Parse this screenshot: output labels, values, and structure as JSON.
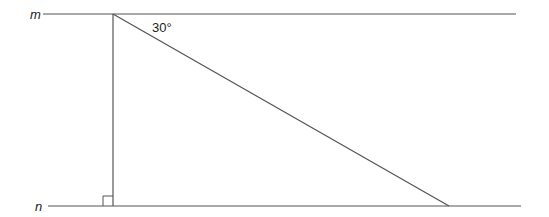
{
  "diagram": {
    "lines": [
      {
        "label": "m",
        "x1": 43,
        "y": 14,
        "x2": 516
      },
      {
        "label": "n",
        "x1": 48,
        "y": 206,
        "x2": 521
      }
    ],
    "vertical": {
      "x": 113,
      "y1": 14,
      "y2": 206
    },
    "diagonal": {
      "x1": 113,
      "y1": 14,
      "x2": 449,
      "y2": 206
    },
    "angle_label": "30°",
    "right_angle_marker": true,
    "stroke_color": "#555555"
  }
}
